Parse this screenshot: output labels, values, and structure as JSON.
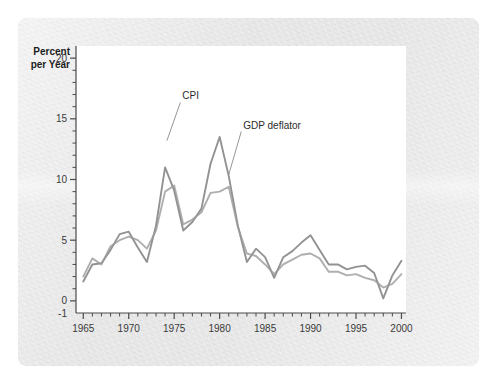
{
  "chart_data": {
    "type": "line",
    "title": "",
    "xlabel": "",
    "ylabel": "Percent per Year",
    "ylabel_line1": "Percent",
    "ylabel_line2": "per Year",
    "xlim": [
      1964.2,
      2000.5
    ],
    "ylim": [
      -1,
      21
    ],
    "y_major_ticks": [
      0,
      5,
      10,
      15,
      20
    ],
    "y_axis_bottom_label": "-1",
    "y_tick_labels": [
      "20",
      "15",
      "10",
      "5",
      "0",
      "-1"
    ],
    "x_major_ticks": [
      1965,
      1970,
      1975,
      1980,
      1985,
      1990,
      1995,
      2000
    ],
    "x_tick_labels": [
      "1965",
      "1970",
      "1975",
      "1980",
      "1985",
      "1990",
      "1995",
      "2000"
    ],
    "x_minor_tick_interval": 1,
    "grid": false,
    "legend_position": "inline-annotations",
    "x": [
      1965,
      1966,
      1967,
      1968,
      1969,
      1970,
      1971,
      1972,
      1973,
      1974,
      1975,
      1976,
      1977,
      1978,
      1979,
      1980,
      1981,
      1982,
      1983,
      1984,
      1985,
      1986,
      1987,
      1988,
      1989,
      1990,
      1991,
      1992,
      1993,
      1994,
      1995,
      1996,
      1997,
      1998,
      1999,
      2000
    ],
    "series": [
      {
        "name": "CPI",
        "color": "#8c8c8c",
        "values": [
          1.6,
          3.0,
          3.1,
          4.2,
          5.5,
          5.7,
          4.4,
          3.2,
          6.2,
          11.0,
          9.1,
          5.8,
          6.5,
          7.6,
          11.3,
          13.5,
          10.3,
          6.2,
          3.2,
          4.3,
          3.6,
          1.9,
          3.6,
          4.1,
          4.8,
          5.4,
          4.2,
          3.0,
          3.0,
          2.6,
          2.8,
          2.9,
          2.3,
          0.2,
          2.1,
          3.3
        ]
      },
      {
        "name": "GDP deflator",
        "color": "#9a9a9a",
        "values": [
          2.0,
          3.5,
          3.0,
          4.5,
          5.0,
          5.3,
          5.0,
          4.3,
          5.8,
          9.0,
          9.5,
          6.3,
          6.7,
          7.3,
          8.9,
          9.0,
          9.4,
          6.1,
          3.9,
          3.7,
          3.0,
          2.2,
          3.0,
          3.4,
          3.8,
          3.9,
          3.5,
          2.4,
          2.4,
          2.1,
          2.2,
          1.9,
          1.7,
          1.1,
          1.4,
          2.2
        ]
      }
    ],
    "annotations": [
      {
        "text": "CPI",
        "x": 1975.9,
        "y": 16.6,
        "points_to_x": 1974.2,
        "points_to_y": 13.2
      },
      {
        "text": "GDP deflator",
        "x": 1982.6,
        "y": 14.2,
        "points_to_x": 1981.0,
        "points_to_y": 10.4
      }
    ]
  }
}
